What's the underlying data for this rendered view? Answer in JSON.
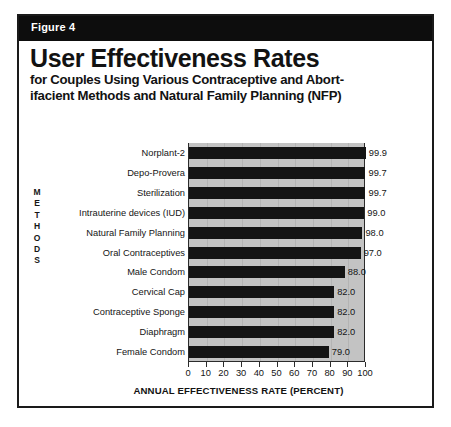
{
  "figure": {
    "band_label": "Figure 4",
    "title": "User Effectiveness Rates",
    "subtitle_line1": "for Couples Using Various Contraceptive and Abort-",
    "subtitle_line2": "ifacient Methods and Natural Family Planning (NFP)"
  },
  "axis": {
    "y_title_letters": [
      "M",
      "E",
      "T",
      "H",
      "O",
      "D",
      "S"
    ],
    "y_title": "METHODS",
    "x_title": "ANNUAL EFFECTIVENESS RATE (PERCENT)"
  },
  "colors": {
    "band_background": "#0d0d0d",
    "band_text": "#ffffff",
    "bar": "#141414",
    "plot_background": "#c3c3c3",
    "border": "#1a1a1a",
    "text": "#141414"
  },
  "chart_data": {
    "type": "bar",
    "orientation": "horizontal",
    "title": "User Effectiveness Rates",
    "subtitle": "for Couples Using Various Contraceptive and Abortifacient Methods and Natural Family Planning (NFP)",
    "xlabel": "ANNUAL EFFECTIVENESS RATE (PERCENT)",
    "ylabel": "METHODS",
    "xlim": [
      0,
      100
    ],
    "xticks": [
      0,
      10,
      20,
      30,
      40,
      50,
      60,
      70,
      80,
      90,
      100
    ],
    "grid": true,
    "legend": null,
    "categories": [
      "Norplant-2",
      "Depo-Provera",
      "Sterilization",
      "Intrauterine devices (IUD)",
      "Natural Family Planning",
      "Oral Contraceptives",
      "Male Condom",
      "Cervical Cap",
      "Contraceptive Sponge",
      "Diaphragm",
      "Female Condom"
    ],
    "values": [
      99.9,
      99.7,
      99.7,
      99.0,
      98.0,
      97.0,
      88.0,
      82.0,
      82.0,
      82.0,
      79.0
    ],
    "value_labels": [
      "99.9",
      "99.7",
      "99.7",
      "99.0",
      "98.0",
      "97.0",
      "88.0",
      "82.0",
      "82.0",
      "82.0",
      "79.0"
    ]
  }
}
